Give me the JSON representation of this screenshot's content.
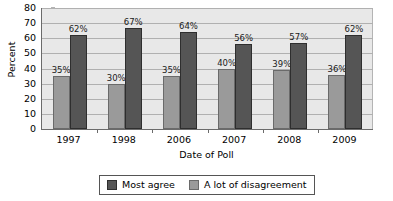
{
  "chart_data": {
    "type": "bar",
    "title": "",
    "categories": [
      "1997",
      "1998",
      "2006",
      "2007",
      "2008",
      "2009"
    ],
    "series": [
      {
        "name": "Most agree",
        "color": "#555555",
        "values": [
          62,
          67,
          64,
          56,
          57,
          62
        ],
        "labels": [
          "62%",
          "67%",
          "64%",
          "56%",
          "57%",
          "62%"
        ]
      },
      {
        "name": "A lot of disagreement",
        "color": "#9a9a9a",
        "values": [
          35,
          30,
          35,
          40,
          39,
          36
        ],
        "labels": [
          "35%",
          "30%",
          "35%",
          "40%",
          "39%",
          "36%"
        ]
      }
    ],
    "xlabel": "Date of Poll",
    "ylabel": "Percent",
    "ylim": [
      0,
      80
    ],
    "yticks": [
      "0",
      "10",
      "20",
      "30",
      "40",
      "50",
      "60",
      "70",
      "80"
    ],
    "ytick_values": [
      0,
      10,
      20,
      30,
      40,
      50,
      60,
      70,
      80
    ],
    "grid": true,
    "legend_position": "bottom",
    "plot_background": "#e8e8e8",
    "bar_order_in_group": [
      "A lot of disagreement",
      "Most agree"
    ]
  },
  "axes": {
    "y_label": "Percent",
    "x_label": "Date of Poll"
  },
  "legend": {
    "items": [
      {
        "label": "Most agree"
      },
      {
        "label": "A lot of disagreement"
      }
    ]
  }
}
